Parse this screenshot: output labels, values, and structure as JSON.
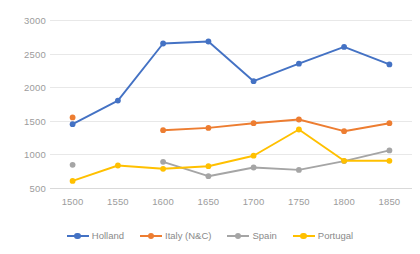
{
  "chart_data": {
    "type": "line",
    "title": "",
    "xlabel": "",
    "ylabel": "",
    "categories": [
      1500,
      1550,
      1600,
      1650,
      1700,
      1750,
      1800,
      1850
    ],
    "x_tick_labels": [
      "1500",
      "1550",
      "1600",
      "1650",
      "1700",
      "1750",
      "1800",
      "1850"
    ],
    "y_tick_labels": [
      "3000",
      "2500",
      "2000",
      "1500",
      "1000",
      "500"
    ],
    "y_ticks": [
      3000,
      2500,
      2000,
      1500,
      1000,
      500
    ],
    "ylim": [
      500,
      3000
    ],
    "xlim": [
      1500,
      1850
    ],
    "grid": true,
    "grid_axis": "y",
    "legend_position": "bottom",
    "markers": "circle",
    "series": [
      {
        "name": "Holland",
        "color": "#4472C4",
        "values": [
          1450,
          1800,
          2650,
          2680,
          2090,
          2350,
          2600,
          2340
        ]
      },
      {
        "name": "Italy (N&C)",
        "color": "#ED7D31",
        "values": [
          1550,
          null,
          1360,
          1395,
          1465,
          1520,
          1345,
          1465
        ]
      },
      {
        "name": "Spain",
        "color": "#A5A5A5",
        "values": [
          845,
          null,
          890,
          675,
          805,
          770,
          900,
          1060
        ]
      },
      {
        "name": "Portugal",
        "color": "#FFC000",
        "values": [
          605,
          835,
          785,
          825,
          980,
          1370,
          905,
          905
        ]
      }
    ]
  },
  "colors": {
    "holland": "#4472C4",
    "italy": "#ED7D31",
    "spain": "#A5A5A5",
    "portugal": "#FFC000",
    "gridline": "#e8e8e8",
    "tick_text": "#9c9c9c",
    "legend_text": "#8a8a8a",
    "background": "#ffffff"
  }
}
